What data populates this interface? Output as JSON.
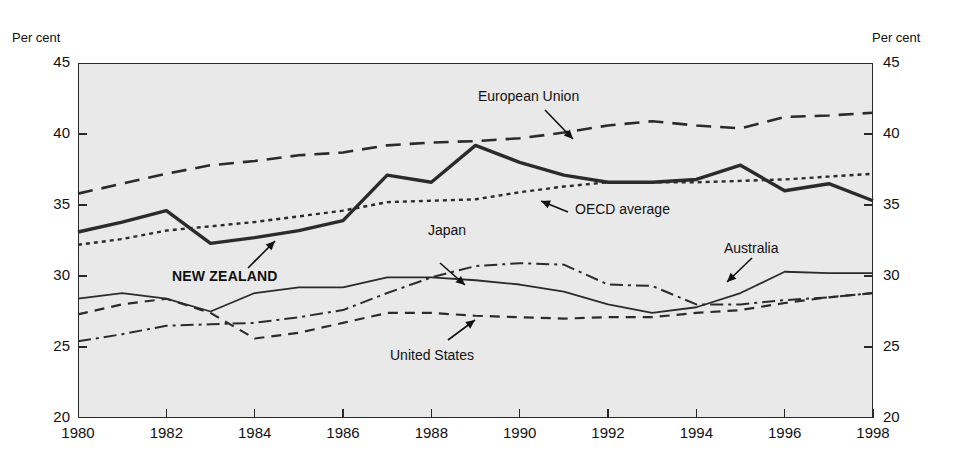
{
  "figure": {
    "title": "",
    "unit_label_left": "Per cent",
    "unit_label_right": "Per cent"
  },
  "axes": {
    "y_ticks": [
      "45",
      "40",
      "35",
      "30",
      "25",
      "20"
    ],
    "x_ticks": [
      "1980",
      "1982",
      "1984",
      "1986",
      "1988",
      "1990",
      "1992",
      "1994",
      "1996",
      "1998"
    ]
  },
  "annotations": {
    "european_union": "European Union",
    "oecd_average": "OECD average",
    "new_zealand": "NEW ZEALAND",
    "japan": "Japan",
    "australia": "Australia",
    "united_states": "United States"
  },
  "chart_data": {
    "type": "line",
    "title": "",
    "xlabel": "",
    "ylabel": "Per cent",
    "xlim": [
      1980,
      1998
    ],
    "ylim": [
      20,
      45
    ],
    "y_ticks": [
      20,
      25,
      30,
      35,
      40,
      45
    ],
    "x_ticks": [
      1980,
      1982,
      1984,
      1986,
      1988,
      1990,
      1992,
      1994,
      1996,
      1998
    ],
    "grid": false,
    "legend": "inline-annotations",
    "x": [
      1980,
      1981,
      1982,
      1983,
      1984,
      1985,
      1986,
      1987,
      1988,
      1989,
      1990,
      1991,
      1992,
      1993,
      1994,
      1995,
      1996,
      1997,
      1998
    ],
    "series": [
      {
        "name": "European Union",
        "style": "long-dash",
        "values": [
          35.8,
          36.5,
          37.2,
          37.8,
          38.1,
          38.5,
          38.7,
          39.2,
          39.4,
          39.5,
          39.7,
          40.1,
          40.6,
          40.9,
          40.6,
          40.4,
          41.2,
          41.3,
          41.5
        ]
      },
      {
        "name": "NEW ZEALAND",
        "style": "thick-solid",
        "values": [
          33.1,
          33.8,
          34.6,
          32.3,
          32.7,
          33.2,
          33.9,
          37.1,
          36.6,
          39.2,
          38.0,
          37.1,
          36.6,
          36.6,
          36.8,
          37.8,
          36.0,
          36.5,
          35.3
        ]
      },
      {
        "name": "OECD average",
        "style": "dotted",
        "values": [
          32.2,
          32.6,
          33.2,
          33.5,
          33.8,
          34.2,
          34.6,
          35.2,
          35.3,
          35.4,
          35.9,
          36.3,
          36.6,
          36.6,
          36.6,
          36.7,
          36.8,
          37.0,
          37.2
        ]
      },
      {
        "name": "Australia",
        "style": "thin-solid",
        "values": [
          28.4,
          28.8,
          28.4,
          27.5,
          28.8,
          29.2,
          29.2,
          29.9,
          29.9,
          29.7,
          29.4,
          28.9,
          28.0,
          27.4,
          27.8,
          28.8,
          30.3,
          30.2,
          30.2
        ]
      },
      {
        "name": "Japan",
        "style": "dash-dot",
        "values": [
          25.4,
          25.9,
          26.5,
          26.6,
          26.7,
          27.1,
          27.6,
          28.8,
          29.9,
          30.7,
          30.9,
          30.8,
          29.4,
          29.3,
          28.0,
          28.0,
          28.3,
          28.5,
          28.8
        ]
      },
      {
        "name": "United States",
        "style": "medium-dash",
        "values": [
          27.3,
          28.0,
          28.4,
          27.4,
          25.6,
          26.0,
          26.7,
          27.4,
          27.4,
          27.2,
          27.1,
          27.0,
          27.1,
          27.1,
          27.4,
          27.6,
          28.1,
          28.5,
          28.8
        ]
      }
    ]
  }
}
